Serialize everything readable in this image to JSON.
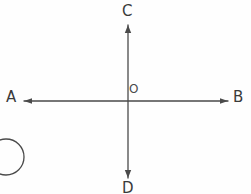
{
  "figure": {
    "type": "geometry-diagram",
    "background_color": "#fefefe",
    "stroke_color": "#4a4a4a",
    "labels": {
      "top": "C",
      "bottom": "D",
      "left": "A",
      "right": "B",
      "origin": "O"
    },
    "lines": [
      {
        "name": "vertical-line-CD",
        "from": "C",
        "to": "D",
        "x1": 128,
        "y1": 25,
        "x2": 128,
        "y2": 178,
        "arrow_start": true,
        "arrow_end": true
      },
      {
        "name": "horizontal-line-AB",
        "from": "A",
        "to": "B",
        "x1": 24,
        "y1": 101,
        "x2": 228,
        "y2": 101,
        "arrow_start": true,
        "arrow_end": true
      }
    ],
    "origin_point": {
      "x": 128,
      "y": 101,
      "label": "O"
    },
    "corner_mark": {
      "name": "circled-item-marker",
      "shape": "circle",
      "cx": 6,
      "cy": 157,
      "r": 18,
      "clipped": true
    }
  }
}
